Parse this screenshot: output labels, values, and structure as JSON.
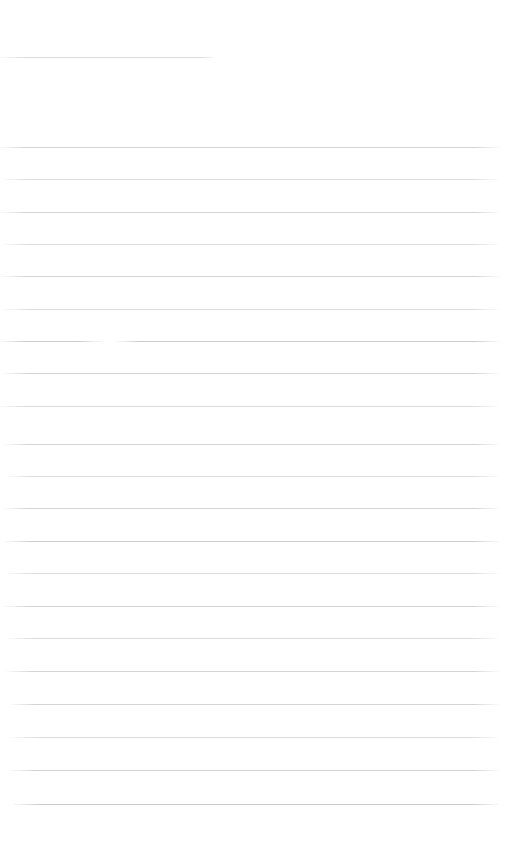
{
  "document": {
    "kind": "scanned-ruled-page",
    "page_label": "",
    "body_text": "",
    "visible_text": "",
    "background_color": "#ffffff",
    "rule_color": "#d5d8dc",
    "page_width": 524,
    "page_height": 862
  },
  "header": {
    "rule": {
      "name": "header-rule",
      "x": 0,
      "y": 57,
      "width": 216,
      "tone": "t-light"
    }
  },
  "body": {
    "line_count": 21,
    "line_spacing": 32.4,
    "first_line_y": 147,
    "last_line_y": 804,
    "left_margin": 0,
    "right_margin": 24,
    "lines": [
      {
        "index": 1,
        "y": 147,
        "x": 0,
        "width": 500,
        "tone": "t-mid",
        "broken": false
      },
      {
        "index": 2,
        "y": 179,
        "x": 2,
        "width": 497,
        "tone": "t-light",
        "broken": false
      },
      {
        "index": 3,
        "y": 212,
        "x": 0,
        "width": 499,
        "tone": "t-mid",
        "broken": false
      },
      {
        "index": 4,
        "y": 244,
        "x": 3,
        "width": 496,
        "tone": "t-light",
        "broken": false
      },
      {
        "index": 5,
        "y": 276,
        "x": 1,
        "width": 499,
        "tone": "t-mid",
        "broken": false
      },
      {
        "index": 6,
        "y": 309,
        "x": 4,
        "width": 495,
        "tone": "t-light",
        "broken": false
      },
      {
        "index": 7,
        "y": 341,
        "x": 0,
        "width": 500,
        "tone": "t-dark",
        "broken": true,
        "gap_start": 103,
        "gap_end": 115
      },
      {
        "index": 8,
        "y": 373,
        "x": 2,
        "width": 497,
        "tone": "t-mid",
        "broken": false
      },
      {
        "index": 9,
        "y": 406,
        "x": 0,
        "width": 499,
        "tone": "t-light",
        "broken": false
      },
      {
        "index": 10,
        "y": 444,
        "x": 4,
        "width": 495,
        "tone": "t-mid",
        "broken": false
      },
      {
        "index": 11,
        "y": 476,
        "x": 6,
        "width": 493,
        "tone": "t-light",
        "broken": false
      },
      {
        "index": 12,
        "y": 508,
        "x": 3,
        "width": 496,
        "tone": "t-mid",
        "broken": false
      },
      {
        "index": 13,
        "y": 541,
        "x": 5,
        "width": 494,
        "tone": "t-dark",
        "broken": false
      },
      {
        "index": 14,
        "y": 573,
        "x": 7,
        "width": 492,
        "tone": "t-light",
        "broken": false
      },
      {
        "index": 15,
        "y": 606,
        "x": 4,
        "width": 495,
        "tone": "t-mid",
        "broken": false
      },
      {
        "index": 16,
        "y": 638,
        "x": 8,
        "width": 491,
        "tone": "t-light",
        "broken": false
      },
      {
        "index": 17,
        "y": 671,
        "x": 6,
        "width": 493,
        "tone": "t-mid",
        "broken": false
      },
      {
        "index": 18,
        "y": 704,
        "x": 10,
        "width": 489,
        "tone": "t-mid",
        "broken": false
      },
      {
        "index": 19,
        "y": 737,
        "x": 12,
        "width": 487,
        "tone": "t-light",
        "broken": false
      },
      {
        "index": 20,
        "y": 770,
        "x": 9,
        "width": 490,
        "tone": "t-mid",
        "broken": false
      },
      {
        "index": 21,
        "y": 804,
        "x": 13,
        "width": 486,
        "tone": "t-dark",
        "broken": false
      }
    ]
  },
  "footer": {
    "blank_space_height": 58,
    "text": ""
  }
}
